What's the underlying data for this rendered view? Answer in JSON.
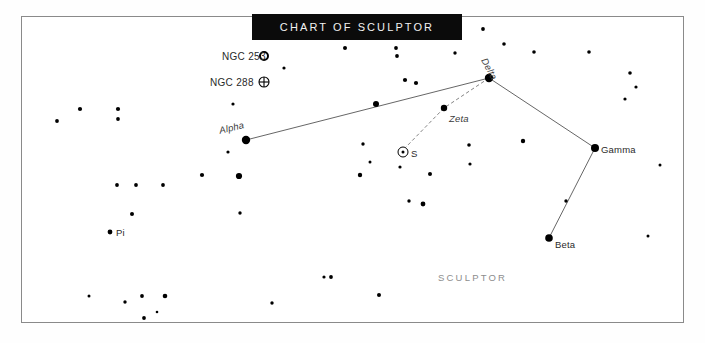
{
  "banner": {
    "title": "CHART OF SCULPTOR"
  },
  "frame": {
    "x": 21,
    "y": 16,
    "width": 662,
    "height": 306,
    "border_color": "#8a8a8a",
    "background": "#ffffff"
  },
  "constellation": {
    "name": "SCULPTOR",
    "name_x": 438,
    "name_y": 272
  },
  "colors": {
    "star": "#000000",
    "line": "#555555",
    "dashed_line": "#777777",
    "banner_bg": "#0b0b0b",
    "banner_text": "#f2f2f2",
    "label_text": "#2a2a2a",
    "constellation_text": "#8d8d8d"
  },
  "chart_data": {
    "type": "scatter",
    "title": "CHART OF SCULPTOR",
    "xlabel": "",
    "ylabel": "",
    "grid": false,
    "legend": "none",
    "named_stars": [
      {
        "name": "Alpha",
        "x": 246,
        "y": 140,
        "r": 4.2,
        "label_x": 218,
        "label_y": 125,
        "label_rotate": -13,
        "italic": true
      },
      {
        "name": "Delta",
        "x": 489,
        "y": 78,
        "r": 4.2,
        "label_x": 489,
        "label_y": 56,
        "label_rotate": 62,
        "italic": true
      },
      {
        "name": "Zeta",
        "x": 444,
        "y": 108,
        "r": 3.2,
        "label_x": 449,
        "label_y": 113,
        "label_rotate": 0,
        "italic": true
      },
      {
        "name": "Gamma",
        "x": 595,
        "y": 148,
        "r": 4.0,
        "label_x": 601,
        "label_y": 144,
        "label_rotate": 0,
        "italic": false
      },
      {
        "name": "Beta",
        "x": 549,
        "y": 238,
        "r": 3.8,
        "label_x": 555,
        "label_y": 239,
        "label_rotate": 0,
        "italic": false
      },
      {
        "name": "Pi",
        "x": 110,
        "y": 232,
        "r": 2.4,
        "label_x": 116,
        "label_y": 227,
        "label_rotate": 0,
        "italic": false
      }
    ],
    "deep_sky_objects": [
      {
        "name": "NGC 253",
        "symbol": "open-circle",
        "sym_x": 264,
        "sym_y": 56,
        "sym_r": 4.0,
        "label_x": 222,
        "label_y": 51
      },
      {
        "name": "NGC 288",
        "symbol": "crossed-circle",
        "sym_x": 264,
        "sym_y": 82,
        "sym_r": 5.0,
        "label_x": 210,
        "label_y": 77
      }
    ],
    "variable_stars": [
      {
        "name": "S",
        "x": 403,
        "y": 152,
        "ring_r": 5.0,
        "dot_r": 1.5,
        "label_x": 411,
        "label_y": 148
      }
    ],
    "constellation_lines": [
      {
        "from": "Alpha",
        "to": "Delta",
        "x1": 246,
        "y1": 140,
        "x2": 489,
        "y2": 78,
        "style": "solid"
      },
      {
        "from": "Delta",
        "to": "Gamma",
        "x1": 489,
        "y1": 78,
        "x2": 595,
        "y2": 148,
        "style": "solid"
      },
      {
        "from": "Gamma",
        "to": "Beta",
        "x1": 595,
        "y1": 148,
        "x2": 549,
        "y2": 238,
        "style": "solid"
      },
      {
        "from": "Delta",
        "to": "Zeta",
        "x1": 489,
        "y1": 78,
        "x2": 444,
        "y2": 108,
        "style": "dashed"
      },
      {
        "from": "Zeta",
        "to": "S",
        "x1": 444,
        "y1": 108,
        "x2": 406,
        "y2": 147,
        "style": "dashed"
      }
    ],
    "field_stars": [
      {
        "x": 57,
        "y": 121,
        "r": 1.9
      },
      {
        "x": 80,
        "y": 109,
        "r": 2.1
      },
      {
        "x": 118,
        "y": 109,
        "r": 2.1
      },
      {
        "x": 118,
        "y": 119,
        "r": 1.9
      },
      {
        "x": 233,
        "y": 104,
        "r": 1.6
      },
      {
        "x": 228,
        "y": 152,
        "r": 1.6
      },
      {
        "x": 269,
        "y": 29,
        "r": 1.8
      },
      {
        "x": 284,
        "y": 68,
        "r": 1.6
      },
      {
        "x": 345,
        "y": 48,
        "r": 2.0
      },
      {
        "x": 396,
        "y": 48,
        "r": 1.9
      },
      {
        "x": 397,
        "y": 56,
        "r": 1.9
      },
      {
        "x": 455,
        "y": 53,
        "r": 1.7
      },
      {
        "x": 457,
        "y": 32,
        "r": 1.6
      },
      {
        "x": 376,
        "y": 104,
        "r": 3.0
      },
      {
        "x": 405,
        "y": 80,
        "r": 2.1
      },
      {
        "x": 416,
        "y": 83,
        "r": 2.1
      },
      {
        "x": 363,
        "y": 144,
        "r": 1.7
      },
      {
        "x": 370,
        "y": 162,
        "r": 1.5
      },
      {
        "x": 400,
        "y": 167,
        "r": 1.6
      },
      {
        "x": 469,
        "y": 145,
        "r": 1.8
      },
      {
        "x": 483,
        "y": 29,
        "r": 1.9
      },
      {
        "x": 504,
        "y": 44,
        "r": 1.8
      },
      {
        "x": 534,
        "y": 52,
        "r": 1.8
      },
      {
        "x": 589,
        "y": 52,
        "r": 1.8
      },
      {
        "x": 630,
        "y": 73,
        "r": 1.8
      },
      {
        "x": 636,
        "y": 87,
        "r": 1.6
      },
      {
        "x": 625,
        "y": 99,
        "r": 1.6
      },
      {
        "x": 523,
        "y": 141,
        "r": 2.2
      },
      {
        "x": 566,
        "y": 201,
        "r": 1.7
      },
      {
        "x": 470,
        "y": 164,
        "r": 1.6
      },
      {
        "x": 117,
        "y": 185,
        "r": 1.9
      },
      {
        "x": 136,
        "y": 185,
        "r": 1.9
      },
      {
        "x": 163,
        "y": 185,
        "r": 1.9
      },
      {
        "x": 202,
        "y": 175,
        "r": 2.1
      },
      {
        "x": 239,
        "y": 176,
        "r": 3.1
      },
      {
        "x": 132,
        "y": 214,
        "r": 2.0
      },
      {
        "x": 240,
        "y": 213,
        "r": 1.7
      },
      {
        "x": 360,
        "y": 175,
        "r": 2.2
      },
      {
        "x": 430,
        "y": 174,
        "r": 2.0
      },
      {
        "x": 409,
        "y": 201,
        "r": 1.7
      },
      {
        "x": 423,
        "y": 204,
        "r": 2.4
      },
      {
        "x": 142,
        "y": 296,
        "r": 1.9
      },
      {
        "x": 165,
        "y": 296,
        "r": 2.3
      },
      {
        "x": 125,
        "y": 302,
        "r": 1.7
      },
      {
        "x": 144,
        "y": 318,
        "r": 1.9
      },
      {
        "x": 157,
        "y": 312,
        "r": 1.3
      },
      {
        "x": 272,
        "y": 303,
        "r": 1.7
      },
      {
        "x": 324,
        "y": 277,
        "r": 1.6
      },
      {
        "x": 331,
        "y": 277,
        "r": 1.9
      },
      {
        "x": 379,
        "y": 295,
        "r": 2.0
      },
      {
        "x": 89,
        "y": 296,
        "r": 1.5
      },
      {
        "x": 660,
        "y": 165,
        "r": 1.5
      },
      {
        "x": 648,
        "y": 236,
        "r": 1.5
      }
    ]
  }
}
